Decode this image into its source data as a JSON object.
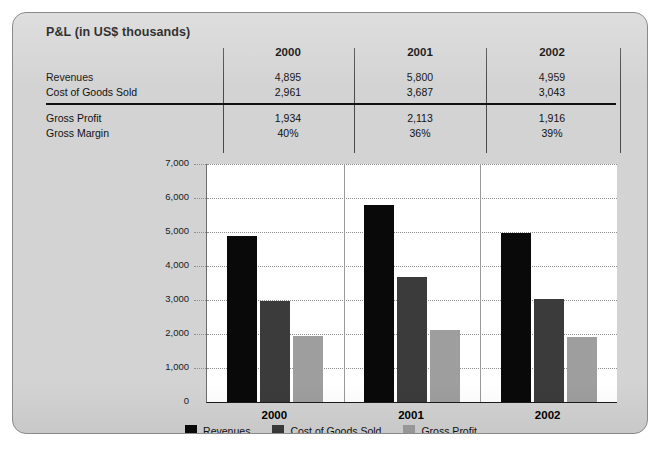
{
  "panel": {
    "title": "P&L (in US$ thousands)",
    "background_color": "#d3d3d3",
    "border_color": "#8a8a8a"
  },
  "table": {
    "columns": [
      "2000",
      "2001",
      "2002"
    ],
    "rows": [
      {
        "label": "Revenues",
        "values": [
          "4,895",
          "5,800",
          "4,959"
        ]
      },
      {
        "label": "Cost of Goods Sold",
        "values": [
          "2,961",
          "3,687",
          "3,043"
        ]
      },
      {
        "label": "Gross Profit",
        "values": [
          "1,934",
          "2,113",
          "1,916"
        ]
      },
      {
        "label": "Gross Margin",
        "values": [
          "40%",
          "36%",
          "39%"
        ]
      }
    ]
  },
  "chart_data": {
    "type": "bar",
    "title": "P&L (in US$ thousands)",
    "xlabel": "",
    "ylabel": "",
    "categories": [
      "2000",
      "2001",
      "2002"
    ],
    "series": [
      {
        "name": "Revenues",
        "color": "#090909",
        "values": [
          4895,
          5800,
          4959
        ]
      },
      {
        "name": "Cost of Goods Sold",
        "color": "#3b3b3b",
        "values": [
          2961,
          3687,
          3043
        ]
      },
      {
        "name": "Gross Profit",
        "color": "#9e9e9e",
        "values": [
          1934,
          2113,
          1916
        ]
      }
    ],
    "ylim": [
      0,
      7000
    ],
    "yticks": [
      0,
      1000,
      2000,
      3000,
      4000,
      5000,
      6000,
      7000
    ],
    "ytick_labels": [
      "0",
      "1,000",
      "2,000",
      "3,000",
      "4,000",
      "5,000",
      "6,000",
      "7,000"
    ],
    "grid": true,
    "grid_style": "dotted-horizontal",
    "legend_position": "bottom-center"
  },
  "legend": {
    "items": [
      {
        "label": "Revenues",
        "color": "#090909"
      },
      {
        "label": "Cost of Goods Sold",
        "color": "#3b3b3b"
      },
      {
        "label": "Gross Profit",
        "color": "#9e9e9e"
      }
    ]
  }
}
